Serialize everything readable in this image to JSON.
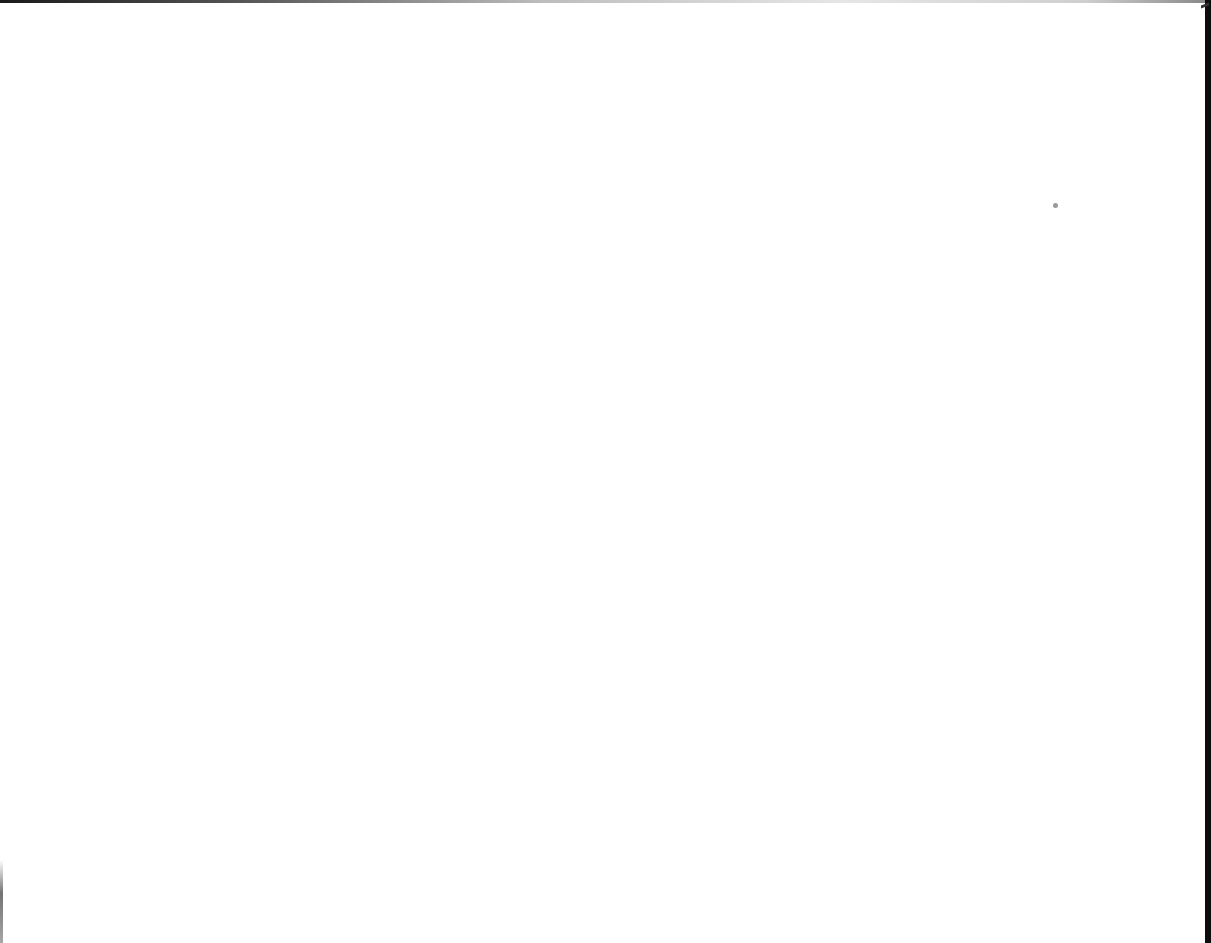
{
  "page": {
    "background_color": "#ffffff",
    "right_border_color": "#0d0d0d",
    "specks": [
      {
        "x": 1053,
        "y": 203,
        "color": "#9a9a9a"
      }
    ]
  }
}
